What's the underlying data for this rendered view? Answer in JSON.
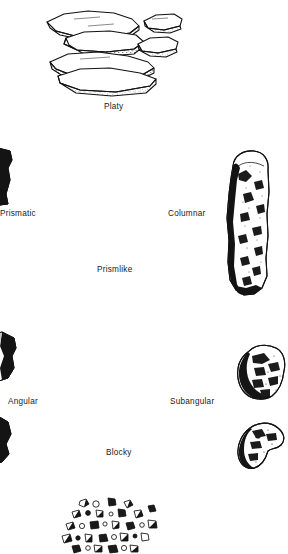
{
  "figure": {
    "background_color": "#ffffff",
    "ink_color": "#1a1a1a",
    "width": 288,
    "height": 554
  },
  "labels": {
    "platy": "Platy",
    "prismlike": "Prismlike",
    "prismatic": "Prismatic",
    "columnar": "Columnar",
    "blocky": "Blocky",
    "angular": "Angular",
    "subangular": "Subangular"
  },
  "illustrations": [
    {
      "name": "platy-peds",
      "description": "cluster of six thin overlapping horizontal plates",
      "group_label": "Platy"
    },
    {
      "name": "prismatic-ped",
      "description": "tall vertical prism with flat top, clipped at left page edge",
      "group_label": "Prismatic"
    },
    {
      "name": "columnar-ped",
      "description": "tall vertical column with rounded dome top",
      "group_label": "Columnar"
    },
    {
      "name": "angular-blocky-ped-upper",
      "description": "sharp-cornered blocky ped, clipped at left page edge",
      "group_label": "Angular"
    },
    {
      "name": "angular-blocky-ped-lower",
      "description": "second sharp-cornered blocky ped, clipped at left page edge",
      "group_label": "Angular"
    },
    {
      "name": "subangular-blocky-ped-upper",
      "description": "rounded-cornered blocky ped",
      "group_label": "Subangular"
    },
    {
      "name": "subangular-blocky-ped-lower",
      "description": "second rounded-cornered blocky ped",
      "group_label": "Subangular"
    },
    {
      "name": "granular-peds",
      "description": "loose cluster of many small rounded granules",
      "group_label": ""
    }
  ]
}
